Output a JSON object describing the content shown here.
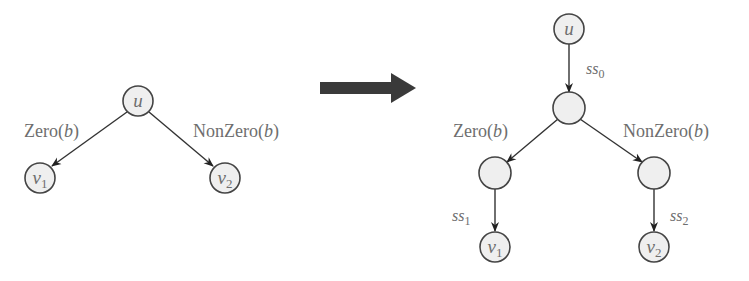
{
  "left_graph": {
    "nodes": {
      "u": {
        "label": "u"
      },
      "v1": {
        "label": "v",
        "sub": "1"
      },
      "v2": {
        "label": "v",
        "sub": "2"
      }
    },
    "edges": {
      "left": {
        "fn": "Zero",
        "arg": "b"
      },
      "right": {
        "fn": "NonZero",
        "arg": "b"
      }
    }
  },
  "transform_arrow": {
    "color": "#3a3a3a"
  },
  "right_graph": {
    "nodes": {
      "u": {
        "label": "u"
      },
      "v1": {
        "label": "v",
        "sub": "1"
      },
      "v2": {
        "label": "v",
        "sub": "2"
      }
    },
    "edges": {
      "top": {
        "label": "ss",
        "sub": "0"
      },
      "left": {
        "fn": "Zero",
        "arg": "b"
      },
      "right": {
        "fn": "NonZero",
        "arg": "b"
      },
      "left_down": {
        "label": "ss",
        "sub": "1"
      },
      "right_down": {
        "label": "ss",
        "sub": "2"
      }
    }
  },
  "colors": {
    "node_fill": "#efefef",
    "node_stroke": "#444444",
    "label_text": "#6e6e6e"
  }
}
